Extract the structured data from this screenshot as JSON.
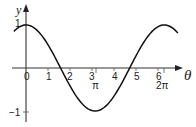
{
  "chart_data": {
    "type": "line",
    "title": "",
    "function": "y = cos θ",
    "xlabel": "θ",
    "ylabel": "y",
    "xlim": [
      -0.6,
      7.2
    ],
    "ylim": [
      -1.2,
      1.4
    ],
    "grid": false,
    "legend": null,
    "x_tick_labels": [
      "0",
      "1",
      "2",
      "3",
      "4",
      "5",
      "6"
    ],
    "x_ticks": [
      0,
      1,
      2,
      3,
      4,
      5,
      6
    ],
    "special_tick_labels": [
      {
        "label": "π",
        "value": 3.14159
      },
      {
        "label": "2π",
        "value": 6.28319
      }
    ],
    "y_tick_labels": [
      "1",
      "−1"
    ],
    "y_ticks": [
      1,
      -1
    ],
    "series": [
      {
        "name": "cos θ",
        "x": [
          -0.55,
          0,
          0.5,
          1.0,
          1.5708,
          2.0,
          2.5,
          3.14159,
          3.5,
          4.0,
          4.7124,
          5.0,
          5.5,
          6.28319,
          6.9
        ],
        "values": [
          0.85,
          1.0,
          0.88,
          0.54,
          0.0,
          -0.42,
          -0.8,
          -1.0,
          -0.94,
          -0.65,
          0.0,
          0.28,
          0.71,
          1.0,
          0.82
        ]
      }
    ]
  },
  "labels": {
    "x_axis": "θ",
    "y_axis": "y",
    "ticks_x": [
      "0",
      "1",
      "2",
      "3",
      "4",
      "5",
      "6"
    ],
    "pi": "π",
    "two_pi": "2π",
    "y_one": "1",
    "y_minus_one": "−1"
  }
}
